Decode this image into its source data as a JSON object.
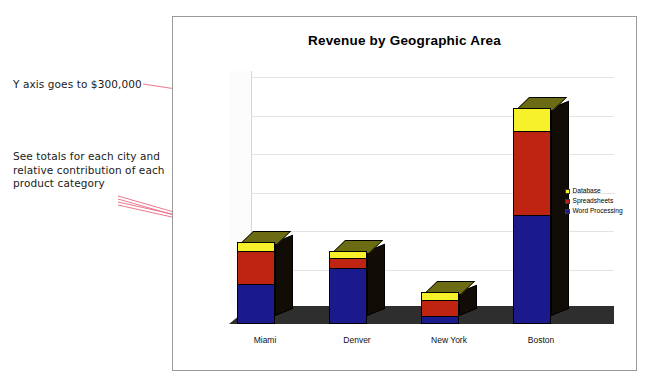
{
  "annotations": [
    {
      "id": "axis-note",
      "text": "Y axis goes to $300,000"
    },
    {
      "id": "totals-note",
      "text": "See totals for each city and\nrelative contribution of each\nproduct category"
    }
  ],
  "legend": {
    "items": [
      {
        "label": "Database",
        "color": "#f6f12a"
      },
      {
        "label": "Spreadsheets",
        "color": "#bf2412"
      },
      {
        "label": "Word Processing",
        "color": "#1a1a8c"
      }
    ]
  },
  "chart_data": {
    "type": "bar",
    "subtype": "stacked-3d-column",
    "title": "Revenue by Geographic Area",
    "xlabel": "",
    "ylabel": "",
    "categories": [
      "Miami",
      "Denver",
      "New York",
      "Boston"
    ],
    "series": [
      {
        "name": "Word Processing",
        "color": "#1a1a8c",
        "values": [
          50000,
          72000,
          8000,
          140000
        ]
      },
      {
        "name": "Spreadsheets",
        "color": "#bf2412",
        "values": [
          44000,
          14000,
          22000,
          110000
        ]
      },
      {
        "name": "Database",
        "color": "#f6f12a",
        "values": [
          13000,
          9000,
          12000,
          30000
        ]
      }
    ],
    "totals": [
      107000,
      95000,
      42000,
      280000
    ],
    "ylim": [
      0,
      300000
    ],
    "ytick_values": [
      0,
      50000,
      100000,
      150000,
      200000,
      250000,
      300000
    ],
    "ytick_labels": [
      "$0",
      "$50,000",
      "$100,000",
      "$150,000",
      "$200,000",
      "$250,000",
      "$300,000"
    ],
    "grid": true,
    "legend_position": "right"
  }
}
